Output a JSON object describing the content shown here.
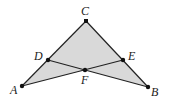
{
  "figure": {
    "fill_color": "#d9d9d9",
    "stroke_color": "#222222",
    "points": {
      "A": {
        "label": "A",
        "x": 22,
        "y": 86,
        "lx": 10,
        "ly": 94
      },
      "B": {
        "label": "B",
        "x": 148,
        "y": 87,
        "lx": 151,
        "ly": 96
      },
      "C": {
        "label": "C",
        "x": 86,
        "y": 21,
        "lx": 81,
        "ly": 15
      },
      "D": {
        "label": "D",
        "x": 48,
        "y": 60,
        "lx": 34,
        "ly": 60
      },
      "E": {
        "label": "E",
        "x": 123,
        "y": 60,
        "lx": 128,
        "ly": 60
      },
      "F": {
        "label": "F",
        "x": 85,
        "y": 70,
        "lx": 81,
        "ly": 84
      }
    },
    "segments": [
      "AC",
      "CB",
      "AE",
      "BD"
    ]
  }
}
